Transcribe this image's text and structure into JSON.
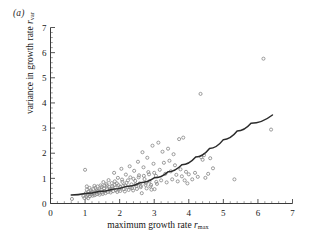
{
  "figure": {
    "panel_label": "(a)",
    "background": "#ffffff",
    "marker_color": "#8a8a8a",
    "curve_color": "#2b2b2b",
    "axis_color": "#3a3a3a"
  },
  "labels": {
    "x_title_main": "maximum growth rate ",
    "x_title_var": "r",
    "x_title_sub": "max",
    "y_title_main": "variance in growth rate ",
    "y_title_var": "r",
    "y_title_sub": "var"
  },
  "chart_data": {
    "type": "scatter",
    "title": "(a)",
    "xlabel": "maximum growth rate r_max",
    "ylabel": "variance in growth rate r_var",
    "xlim": [
      0,
      7
    ],
    "ylim": [
      0,
      7
    ],
    "xticks": [
      0,
      1,
      2,
      3,
      4,
      5,
      6,
      7
    ],
    "yticks": [
      0,
      1,
      2,
      3,
      4,
      5,
      6,
      7
    ],
    "xtick_labels": [
      "0",
      "1",
      "2",
      "3",
      "4",
      "5",
      "6",
      "7"
    ],
    "ytick_labels": [
      "0",
      "1",
      "2",
      "3",
      "4",
      "5",
      "6",
      "7"
    ],
    "minor_ticks_per_interval": 4,
    "grid": false,
    "legend": null,
    "marker": "open-circle",
    "marker_size": 3.1,
    "points": [
      [
        0.62,
        0.18
      ],
      [
        0.95,
        0.3
      ],
      [
        0.98,
        0.22
      ],
      [
        1.0,
        1.34
      ],
      [
        1.02,
        0.41
      ],
      [
        1.04,
        0.26
      ],
      [
        1.05,
        0.55
      ],
      [
        1.07,
        0.34
      ],
      [
        1.09,
        0.21
      ],
      [
        1.1,
        0.47
      ],
      [
        1.12,
        0.38
      ],
      [
        1.14,
        0.29
      ],
      [
        1.16,
        0.52
      ],
      [
        1.18,
        0.35
      ],
      [
        1.2,
        0.44
      ],
      [
        1.22,
        0.31
      ],
      [
        1.24,
        0.58
      ],
      [
        1.26,
        0.4
      ],
      [
        1.28,
        0.33
      ],
      [
        1.3,
        0.62
      ],
      [
        1.32,
        0.46
      ],
      [
        1.34,
        0.37
      ],
      [
        1.36,
        0.68
      ],
      [
        1.38,
        0.5
      ],
      [
        1.4,
        0.42
      ],
      [
        1.42,
        0.35
      ],
      [
        1.45,
        0.72
      ],
      [
        1.47,
        0.55
      ],
      [
        1.49,
        0.44
      ],
      [
        1.51,
        0.38
      ],
      [
        1.53,
        0.85
      ],
      [
        1.55,
        0.61
      ],
      [
        1.57,
        0.49
      ],
      [
        1.59,
        0.41
      ],
      [
        1.62,
        0.78
      ],
      [
        1.64,
        0.57
      ],
      [
        1.66,
        0.46
      ],
      [
        1.68,
        0.93
      ],
      [
        1.7,
        0.66
      ],
      [
        1.72,
        0.52
      ],
      [
        1.74,
        0.44
      ],
      [
        1.77,
        0.81
      ],
      [
        1.79,
        0.6
      ],
      [
        1.81,
        0.49
      ],
      [
        1.84,
        1.22
      ],
      [
        1.86,
        0.88
      ],
      [
        1.88,
        0.64
      ],
      [
        1.9,
        0.53
      ],
      [
        1.93,
        0.46
      ],
      [
        1.95,
        1.02
      ],
      [
        1.97,
        0.73
      ],
      [
        2.0,
        0.58
      ],
      [
        2.02,
        0.5
      ],
      [
        2.05,
        1.38
      ],
      [
        2.07,
        0.95
      ],
      [
        2.1,
        0.7
      ],
      [
        2.12,
        0.57
      ],
      [
        2.15,
        0.48
      ],
      [
        2.18,
        1.15
      ],
      [
        2.2,
        0.82
      ],
      [
        2.23,
        0.64
      ],
      [
        2.26,
        0.54
      ],
      [
        2.29,
        1.48
      ],
      [
        2.31,
        1.04
      ],
      [
        2.34,
        0.76
      ],
      [
        2.36,
        0.61
      ],
      [
        2.39,
        0.52
      ],
      [
        2.42,
        1.3
      ],
      [
        2.45,
        0.9
      ],
      [
        2.48,
        0.69
      ],
      [
        2.5,
        0.58
      ],
      [
        2.53,
        1.66
      ],
      [
        2.56,
        1.12
      ],
      [
        2.58,
        0.8
      ],
      [
        2.61,
        0.65
      ],
      [
        2.64,
        0.41
      ],
      [
        2.66,
        2.04
      ],
      [
        2.69,
        1.44
      ],
      [
        2.72,
        0.97
      ],
      [
        2.75,
        0.74
      ],
      [
        2.78,
        0.6
      ],
      [
        2.8,
        1.82
      ],
      [
        2.83,
        1.25
      ],
      [
        2.86,
        0.88
      ],
      [
        2.89,
        0.68
      ],
      [
        2.92,
        0.55
      ],
      [
        2.95,
        2.3
      ],
      [
        2.98,
        1.58
      ],
      [
        3.01,
        0.57
      ],
      [
        3.05,
        1.1
      ],
      [
        3.08,
        0.78
      ],
      [
        3.12,
        2.42
      ],
      [
        3.16,
        1.34
      ],
      [
        3.2,
        0.92
      ],
      [
        3.24,
        2.06
      ],
      [
        3.28,
        1.62
      ],
      [
        3.32,
        1.18
      ],
      [
        3.36,
        0.84
      ],
      [
        3.4,
        2.18
      ],
      [
        3.44,
        1.7
      ],
      [
        3.48,
        1.28
      ],
      [
        3.52,
        0.96
      ],
      [
        3.56,
        1.96
      ],
      [
        3.6,
        1.52
      ],
      [
        3.64,
        1.14
      ],
      [
        3.68,
        0.88
      ],
      [
        3.72,
        2.56
      ],
      [
        3.76,
        1.36
      ],
      [
        3.8,
        1.08
      ],
      [
        3.84,
        2.62
      ],
      [
        3.88,
        0.92
      ],
      [
        3.92,
        1.26
      ],
      [
        3.96,
        0.8
      ],
      [
        4.0,
        1.16
      ],
      [
        4.1,
        0.96
      ],
      [
        4.18,
        1.22
      ],
      [
        4.26,
        1.06
      ],
      [
        4.34,
        4.36
      ],
      [
        4.36,
        1.84
      ],
      [
        4.4,
        1.74
      ],
      [
        4.44,
        1.92
      ],
      [
        4.48,
        1.02
      ],
      [
        4.56,
        1.18
      ],
      [
        4.62,
        1.8
      ],
      [
        4.7,
        1.4
      ],
      [
        5.32,
        0.96
      ],
      [
        6.16,
        5.76
      ],
      [
        6.38,
        2.94
      ],
      [
        1.13,
        0.62
      ],
      [
        1.27,
        0.7
      ],
      [
        1.41,
        0.56
      ],
      [
        1.56,
        0.7
      ],
      [
        1.71,
        0.58
      ],
      [
        1.86,
        0.74
      ],
      [
        2.01,
        0.66
      ],
      [
        2.16,
        0.72
      ],
      [
        2.31,
        0.64
      ],
      [
        2.46,
        0.76
      ],
      [
        2.61,
        0.7
      ],
      [
        2.76,
        0.82
      ],
      [
        2.91,
        0.74
      ],
      [
        3.06,
        0.86
      ],
      [
        1.05,
        0.68
      ],
      [
        1.19,
        0.46
      ],
      [
        1.33,
        0.52
      ],
      [
        1.48,
        0.66
      ],
      [
        1.63,
        0.72
      ],
      [
        1.78,
        0.68
      ],
      [
        1.92,
        0.8
      ],
      [
        2.08,
        0.86
      ],
      [
        2.24,
        0.92
      ],
      [
        2.4,
        0.98
      ],
      [
        2.55,
        1.04
      ],
      [
        2.7,
        1.1
      ],
      [
        2.85,
        1.16
      ],
      [
        3.0,
        1.22
      ]
    ],
    "fit_curve": {
      "label": "fitted curve",
      "x_start": 0.6,
      "x_end": 6.42,
      "description": "increasing convex fit of variance against maximum growth rate",
      "samples": [
        [
          0.6,
          0.34
        ],
        [
          1.0,
          0.4
        ],
        [
          1.4,
          0.48
        ],
        [
          1.8,
          0.57
        ],
        [
          2.2,
          0.68
        ],
        [
          2.6,
          0.83
        ],
        [
          3.0,
          1.02
        ],
        [
          3.4,
          1.26
        ],
        [
          3.8,
          1.54
        ],
        [
          4.2,
          1.85
        ],
        [
          4.6,
          2.19
        ],
        [
          5.0,
          2.54
        ],
        [
          5.4,
          2.88
        ],
        [
          5.8,
          3.19
        ],
        [
          6.42,
          3.52
        ]
      ]
    }
  }
}
